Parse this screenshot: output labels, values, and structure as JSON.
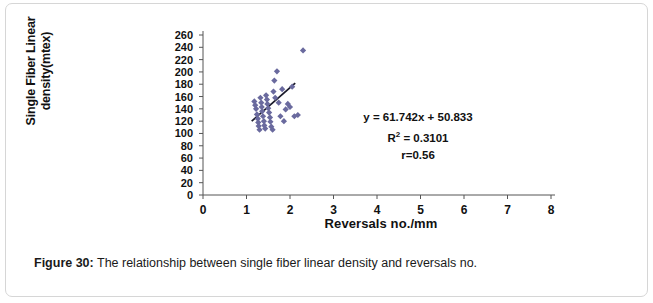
{
  "figure": {
    "caption_label": "Figure 30:",
    "caption_text": " The relationship between single fiber linear density and reversals no."
  },
  "annotation": {
    "equation": "y = 61.742x + 50.833",
    "r_squared_prefix": "R",
    "r_squared_exp": "2",
    "r_squared_value": " = 0.3101",
    "correlation": "r=0.56"
  },
  "colors": {
    "marker": "#6a6a9e",
    "trendline": "#1a1a2a",
    "axis": "#555555",
    "text": "#111111",
    "frame_border": "#d6d6d6"
  },
  "chart_data": {
    "type": "scatter",
    "title": "",
    "xlabel": "Reversals no./mm",
    "ylabel": "Single Fiber Linear density(mtex)",
    "xlim": [
      0,
      8
    ],
    "ylim": [
      0,
      260
    ],
    "xticks": [
      0,
      1,
      2,
      3,
      4,
      5,
      6,
      7,
      8
    ],
    "yticks": [
      0,
      20,
      40,
      60,
      80,
      100,
      120,
      140,
      160,
      180,
      200,
      220,
      240,
      260
    ],
    "grid": false,
    "legend": "none",
    "series": [
      {
        "name": "Single fiber linear density vs reversals",
        "marker": "diamond",
        "points": [
          [
            1.18,
            152
          ],
          [
            1.2,
            146
          ],
          [
            1.22,
            140
          ],
          [
            1.24,
            131
          ],
          [
            1.26,
            124
          ],
          [
            1.27,
            118
          ],
          [
            1.28,
            112
          ],
          [
            1.3,
            106
          ],
          [
            1.32,
            158
          ],
          [
            1.34,
            150
          ],
          [
            1.35,
            143
          ],
          [
            1.36,
            136
          ],
          [
            1.38,
            128
          ],
          [
            1.4,
            120
          ],
          [
            1.41,
            113
          ],
          [
            1.43,
            108
          ],
          [
            1.45,
            162
          ],
          [
            1.47,
            155
          ],
          [
            1.48,
            148
          ],
          [
            1.5,
            141
          ],
          [
            1.52,
            134
          ],
          [
            1.54,
            126
          ],
          [
            1.55,
            119
          ],
          [
            1.57,
            111
          ],
          [
            1.6,
            106
          ],
          [
            1.62,
            168
          ],
          [
            1.64,
            186
          ],
          [
            1.66,
            158
          ],
          [
            1.7,
            201
          ],
          [
            1.74,
            150
          ],
          [
            1.78,
            128
          ],
          [
            1.82,
            172
          ],
          [
            1.86,
            120
          ],
          [
            1.9,
            139
          ],
          [
            1.95,
            148
          ],
          [
            2.0,
            143
          ],
          [
            2.05,
            176
          ],
          [
            2.1,
            128
          ],
          [
            2.18,
            130
          ],
          [
            2.3,
            235
          ]
        ]
      }
    ],
    "trendline": {
      "equation": "y = 61.742x + 50.833",
      "slope": 61.742,
      "intercept": 50.833,
      "r_squared": 0.3101,
      "r": 0.56,
      "x_start": 1.12,
      "x_end": 2.12
    }
  }
}
